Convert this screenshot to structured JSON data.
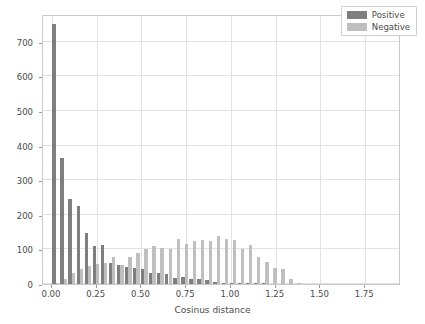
{
  "chart_data": {
    "type": "bar",
    "title": "",
    "xlabel": "Cosinus distance",
    "ylabel": "",
    "xlim": [
      -0.05,
      1.95
    ],
    "ylim": [
      0,
      780
    ],
    "grid": true,
    "legend_position": "upper right",
    "xticks": [
      "0.00",
      "0.25",
      "0.50",
      "0.75",
      "1.00",
      "1.25",
      "1.50",
      "1.75"
    ],
    "xtick_values": [
      0.0,
      0.25,
      0.5,
      0.75,
      1.0,
      1.25,
      1.5,
      1.75
    ],
    "yticks": [
      "0",
      "100",
      "200",
      "300",
      "400",
      "500",
      "600",
      "700"
    ],
    "ytick_values": [
      0,
      100,
      200,
      300,
      400,
      500,
      600,
      700
    ],
    "colors": {
      "positive": "#7f7f7f",
      "negative": "#bfbfbf"
    },
    "bin_centers": [
      0.0225,
      0.0675,
      0.1125,
      0.1575,
      0.2025,
      0.2475,
      0.2925,
      0.3375,
      0.3825,
      0.4275,
      0.4725,
      0.5175,
      0.5625,
      0.6075,
      0.6525,
      0.6975,
      0.7425,
      0.7875,
      0.8325,
      0.8775,
      0.9225,
      0.9675,
      1.0125,
      1.0575,
      1.1025,
      1.1475,
      1.1925,
      1.2375,
      1.2825,
      1.3275,
      1.3725,
      1.4175,
      1.4625,
      1.5075,
      1.5525,
      1.5975,
      1.6425,
      1.6875,
      1.7325,
      1.7775,
      1.8225,
      1.8675
    ],
    "series": [
      {
        "name": "Positive",
        "color": "#7f7f7f",
        "values": [
          752,
          363,
          245,
          224,
          148,
          110,
          113,
          62,
          55,
          50,
          45,
          42,
          31,
          33,
          28,
          17,
          20,
          14,
          15,
          11,
          5,
          3,
          2,
          2,
          1,
          1,
          1,
          0,
          0,
          0,
          0,
          0,
          0,
          0,
          0,
          0,
          0,
          0,
          0,
          0,
          0,
          0
        ]
      },
      {
        "name": "Negative",
        "color": "#bfbfbf",
        "values": [
          2,
          14,
          31,
          43,
          52,
          59,
          62,
          79,
          55,
          78,
          89,
          101,
          110,
          105,
          102,
          131,
          116,
          123,
          126,
          123,
          139,
          130,
          126,
          100,
          114,
          78,
          64,
          46,
          44,
          15,
          4,
          0,
          0,
          0,
          0,
          0,
          0,
          0,
          0,
          0,
          0,
          0
        ]
      }
    ]
  },
  "legend": {
    "items": [
      {
        "label": "Positive",
        "kind": "pos"
      },
      {
        "label": "Negative",
        "kind": "neg"
      }
    ]
  }
}
